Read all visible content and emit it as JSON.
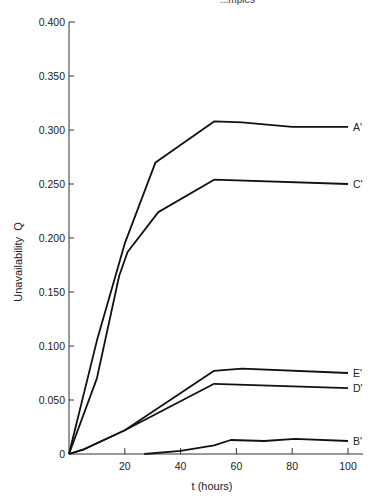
{
  "header_fragment": "...mples",
  "chart_data": {
    "type": "line",
    "title": "",
    "xlabel": "t (hours)",
    "ylabel": "Unavailability  Q",
    "xlim": [
      0,
      100
    ],
    "ylim": [
      0,
      0.4
    ],
    "grid": false,
    "legend": "inline labels at right end of each line",
    "x_ticks": [
      20,
      40,
      60,
      80,
      100
    ],
    "x_tick_labels": [
      "20",
      "40",
      "60",
      "80",
      "100"
    ],
    "y_ticks": [
      0,
      0.05,
      0.1,
      0.15,
      0.2,
      0.25,
      0.3,
      0.35,
      0.4
    ],
    "y_tick_labels": [
      "0",
      "0.050",
      "0.100",
      "0.150",
      "0.200",
      "0.250",
      "0.300",
      "0.350",
      "0.400"
    ],
    "series": [
      {
        "name": "A'",
        "x": [
          0,
          10,
          20,
          31,
          52,
          62,
          80,
          100
        ],
        "y": [
          0,
          0.105,
          0.195,
          0.27,
          0.308,
          0.307,
          0.303,
          0.303
        ]
      },
      {
        "name": "C'",
        "x": [
          0,
          10,
          18,
          21,
          32,
          52,
          100
        ],
        "y": [
          0,
          0.07,
          0.165,
          0.187,
          0.224,
          0.254,
          0.25
        ]
      },
      {
        "name": "E'",
        "x": [
          0,
          5,
          20,
          52,
          62,
          100
        ],
        "y": [
          0,
          0.004,
          0.022,
          0.077,
          0.079,
          0.075
        ]
      },
      {
        "name": "D'",
        "x": [
          0,
          5,
          20,
          52,
          100
        ],
        "y": [
          0,
          0.004,
          0.022,
          0.065,
          0.061
        ]
      },
      {
        "name": "B'",
        "x": [
          27,
          40,
          52,
          58,
          70,
          81,
          100
        ],
        "y": [
          0,
          0.003,
          0.008,
          0.013,
          0.012,
          0.014,
          0.012
        ]
      }
    ]
  },
  "layout": {
    "origin_px": [
      69,
      454
    ],
    "x_px_per_unit": 2.79,
    "y_px_per_unit": 1080,
    "x_axis_end_px": 363,
    "line_color": "#111111"
  }
}
